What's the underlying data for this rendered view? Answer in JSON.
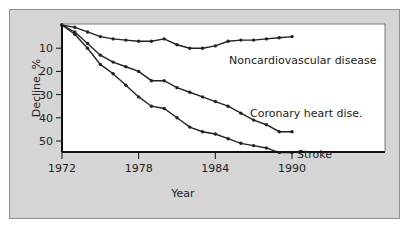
{
  "chart_data": {
    "type": "line",
    "title": "",
    "xlabel": "Year",
    "ylabel": "Decline, %",
    "x": [
      1972,
      1973,
      1974,
      1975,
      1976,
      1977,
      1978,
      1979,
      1980,
      1981,
      1982,
      1983,
      1984,
      1985,
      1986,
      1987,
      1988,
      1989,
      1990
    ],
    "xticks": [
      1972,
      1978,
      1984,
      1990
    ],
    "yticks": [
      10,
      20,
      30,
      40,
      50
    ],
    "xlim": [
      1972,
      1990
    ],
    "ylim": [
      0,
      55
    ],
    "y_inverted": true,
    "grid": false,
    "legend_position": "inline labels at line ends",
    "series": [
      {
        "name": "Noncardiovascular disease",
        "values": [
          0,
          1,
          3,
          5,
          6,
          6.5,
          7,
          7,
          6,
          8.5,
          10,
          10,
          9,
          7,
          6.5,
          6.5,
          6,
          5.5,
          5
        ]
      },
      {
        "name": "Coronary heart dise.",
        "values": [
          0,
          3,
          8,
          13,
          16,
          18,
          20,
          24,
          24,
          27,
          29,
          31,
          33,
          35,
          38,
          41,
          43,
          46,
          46
        ]
      },
      {
        "name": "Stroke",
        "values": [
          0,
          4,
          10,
          17,
          21,
          26,
          31,
          35,
          36,
          40,
          44,
          46,
          47,
          49,
          51,
          52,
          53,
          55,
          55
        ]
      }
    ]
  },
  "colors": {
    "panel": "#d5d5d5",
    "plot": "#ffffff",
    "line": "#222222"
  }
}
